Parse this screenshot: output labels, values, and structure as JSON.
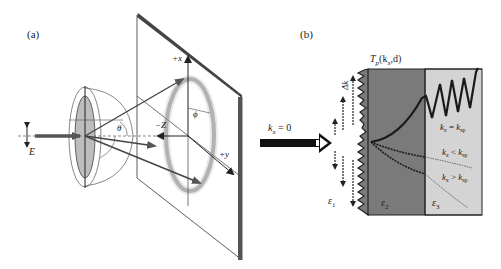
{
  "panel_a": {
    "label": "(a)",
    "axis_x": "+x",
    "axis_y": "+y",
    "axis_z": "−Z",
    "angle_theta": "θ",
    "angle_phi": "ϕ",
    "field": "E"
  },
  "panel_b": {
    "label": "(b)",
    "title_T": "T",
    "title_sub": "p",
    "title_args": "(k",
    "title_args_sub": "x",
    "title_args_end": ",d)",
    "incident_label": "k",
    "incident_sub": "x",
    "incident_value": " = 0",
    "delta_k": "Δk",
    "eps1": "ε",
    "eps1_sub": "1",
    "eps2": "ε",
    "eps2_sub": "2",
    "eps3": "ε",
    "eps3_sub": "3",
    "curve_eq": {
      "k": "k",
      "sub": "x",
      "rel": " = ",
      "k2": "k",
      "sub2": "sp"
    },
    "curve_lt": {
      "k": "k",
      "sub": "x",
      "rel": " < ",
      "k2": "k",
      "sub2": "sp"
    },
    "curve_gt": {
      "k": "k",
      "sub": "x",
      "rel": " > ",
      "k2": "k",
      "sub2": "sp"
    },
    "colors": {
      "eps2_region": "#7a7a7a",
      "eps3_region": "#d4d4d4",
      "curve": "#1a1a1a"
    }
  }
}
